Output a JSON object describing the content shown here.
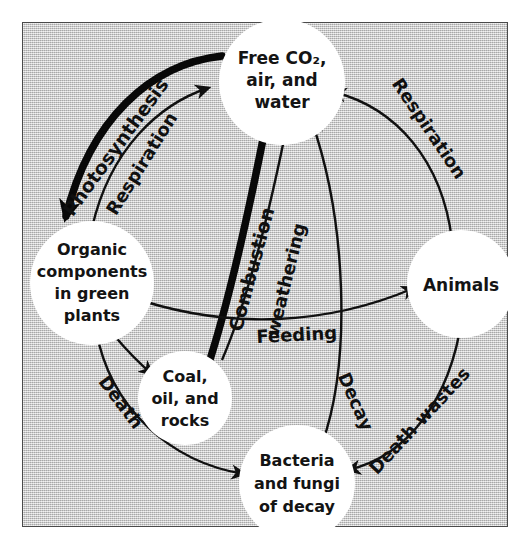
{
  "figure": {
    "type": "cycle-diagram",
    "background_color": "#c9c9c9",
    "node_color": "#ffffff",
    "ink_color": "#101010"
  },
  "nodes": {
    "co2": {
      "id": "free-co2",
      "lines": [
        "Free CO₂,",
        "air, and",
        "water"
      ]
    },
    "plants": {
      "id": "organic-components",
      "lines": [
        "Organic",
        "components",
        "in green",
        "plants"
      ]
    },
    "animals": {
      "id": "animals",
      "lines": [
        "Animals"
      ]
    },
    "bacteria": {
      "id": "bacteria-fungi",
      "lines": [
        "Bacteria",
        "and fungi",
        "of decay"
      ]
    },
    "fossil": {
      "id": "coal-oil-rocks",
      "lines": [
        "Coal,",
        "oil, and",
        "rocks"
      ]
    }
  },
  "edges": {
    "photosynthesis": {
      "label": "Photosynthesis",
      "from": "free-co2",
      "to": "organic-components",
      "weight": "thick"
    },
    "respiration_plants": {
      "label": "Respiration",
      "from": "organic-components",
      "to": "free-co2",
      "weight": "thin"
    },
    "respiration_animals": {
      "label": "Respiration",
      "from": "animals",
      "to": "free-co2",
      "weight": "thin"
    },
    "combustion": {
      "label": "Combustion",
      "from": "coal-oil-rocks",
      "to": "free-co2",
      "weight": "thick"
    },
    "weathering": {
      "label": "weathering",
      "from": "coal-oil-rocks",
      "to": "free-co2",
      "weight": "thin"
    },
    "feeding": {
      "label": "Feeding",
      "from": "organic-components",
      "to": "animals",
      "weight": "thin"
    },
    "decay": {
      "label": "Decay",
      "from": "bacteria-fungi",
      "to": "free-co2",
      "weight": "thin"
    },
    "death": {
      "label": "Death",
      "from": "organic-components",
      "to": "bacteria-fungi",
      "weight": "thin"
    },
    "death_wastes": {
      "label": "Death wastes",
      "from": "animals",
      "to": "bacteria-fungi",
      "weight": "thin"
    },
    "burial": {
      "label": "",
      "from": "organic-components",
      "to": "coal-oil-rocks",
      "weight": "thin"
    }
  }
}
